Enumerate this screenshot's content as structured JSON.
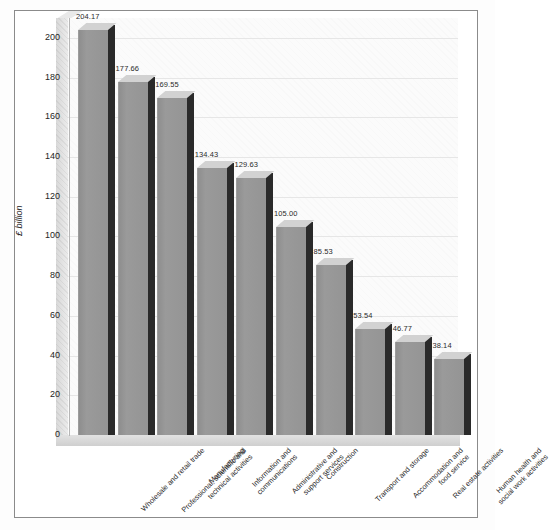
{
  "chart_data": {
    "type": "bar",
    "title": "",
    "xlabel": "",
    "ylabel": "£ billion",
    "ylim": [
      0,
      210
    ],
    "grid": true,
    "legend": "none",
    "style": "3d-bar",
    "ytick_labels": [
      "0",
      "20",
      "40",
      "60",
      "80",
      "100",
      "120",
      "140",
      "160",
      "180",
      "200"
    ],
    "ytick_values": [
      0,
      20,
      40,
      60,
      80,
      100,
      120,
      140,
      160,
      180,
      200
    ],
    "categories": [
      "Wholesale and retail trade",
      "Professional, scientific and technical activities",
      "Manufacturing",
      "Information and communications",
      "Administrative and support services",
      "Construction",
      "Transport and storage",
      "Accommodation and food service",
      "Real estate activities",
      "Human health and social work activities"
    ],
    "category_lines": [
      [
        "Wholesale and retail trade"
      ],
      [
        "Professional, scientific and",
        "technical activities"
      ],
      [
        "Manufacturing"
      ],
      [
        "Information and",
        "communications"
      ],
      [
        "Administrative and",
        "support services"
      ],
      [
        "Construction"
      ],
      [
        "Transport and storage"
      ],
      [
        "Accommodation and",
        "food service"
      ],
      [
        "Real estate activities"
      ],
      [
        "Human health and",
        "social work activities"
      ]
    ],
    "values": [
      204.17,
      177.66,
      169.55,
      134.43,
      129.63,
      105.0,
      85.53,
      53.54,
      46.77,
      38.14
    ],
    "value_labels": [
      "204.17",
      "177.66",
      "169.55",
      "134.43",
      "129.63",
      "105.00",
      "85.53",
      "53.54",
      "46.77",
      "38.14"
    ],
    "colors": {
      "bar_front": "#949494",
      "bar_top": "#d2d2d2",
      "bar_side": "#2a2a2a",
      "plot_background": "#fbfbfb",
      "gridline": "#e6e6e6",
      "frame_border": "#8b8b8b",
      "text": "#252525"
    }
  }
}
